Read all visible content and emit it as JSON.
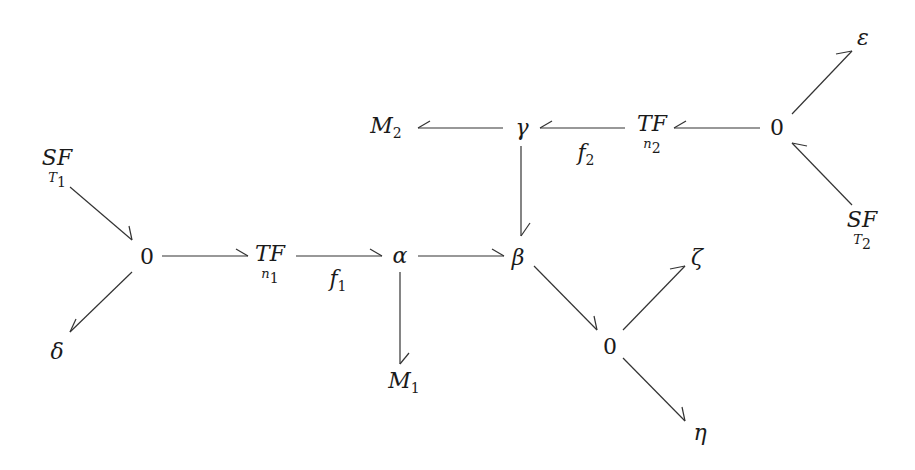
{
  "diagram": {
    "type": "bond-graph",
    "nodes": {
      "sf_t1": {
        "label": "SF",
        "sub": "T",
        "sub_index": "1"
      },
      "zero_left": {
        "label": "0"
      },
      "delta": {
        "label": "δ"
      },
      "tf_n1": {
        "label": "TF",
        "sub": "n",
        "sub_index": "1"
      },
      "f1": {
        "label": "f",
        "index": "1"
      },
      "alpha": {
        "label": "α"
      },
      "m1": {
        "label": "M",
        "index": "1"
      },
      "beta": {
        "label": "β"
      },
      "gamma": {
        "label": "γ"
      },
      "m2": {
        "label": "M",
        "index": "2"
      },
      "f2": {
        "label": "f",
        "index": "2"
      },
      "tf_n2": {
        "label": "TF",
        "sub": "n",
        "sub_index": "2"
      },
      "zero_right": {
        "label": "0"
      },
      "epsilon": {
        "label": "ε"
      },
      "sf_t2": {
        "label": "SF",
        "sub": "T",
        "sub_index": "2"
      },
      "zero_lower": {
        "label": "0"
      },
      "zeta": {
        "label": "ζ"
      },
      "eta": {
        "label": "η"
      }
    },
    "bonds": [
      {
        "from": "SF_T1",
        "to": "0 (left)"
      },
      {
        "from": "0 (left)",
        "to": "δ"
      },
      {
        "from": "0 (left)",
        "to": "TF n1"
      },
      {
        "from": "TF n1",
        "to": "α",
        "label": "f1"
      },
      {
        "from": "α",
        "to": "M1"
      },
      {
        "from": "α",
        "to": "β"
      },
      {
        "from": "γ",
        "to": "β"
      },
      {
        "from": "γ",
        "to": "M2"
      },
      {
        "from": "TF n2",
        "to": "γ",
        "label": "f2"
      },
      {
        "from": "0 (right)",
        "to": "TF n2"
      },
      {
        "from": "0 (right)",
        "to": "ε"
      },
      {
        "from": "SF_T2",
        "to": "0 (right)"
      },
      {
        "from": "β",
        "to": "0 (lower)"
      },
      {
        "from": "0 (lower)",
        "to": "ζ"
      },
      {
        "from": "0 (lower)",
        "to": "η"
      }
    ],
    "colors": {
      "stroke": "#333333",
      "text": "#1a1a1a",
      "background": "#ffffff"
    }
  }
}
